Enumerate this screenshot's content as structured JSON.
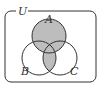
{
  "diagram": {
    "type": "venn",
    "universe_label": "U",
    "sets": [
      {
        "name": "A",
        "cx": 49,
        "cy": 36,
        "r": 17
      },
      {
        "name": "B",
        "cx": 39,
        "cy": 58,
        "r": 17
      },
      {
        "name": "C",
        "cx": 60,
        "cy": 58,
        "r": 17
      }
    ],
    "shaded_region": "A ∪ (B ∩ C)",
    "colors": {
      "shade": "#bdbdbd",
      "stroke": "#333333",
      "background": "#ffffff"
    }
  }
}
